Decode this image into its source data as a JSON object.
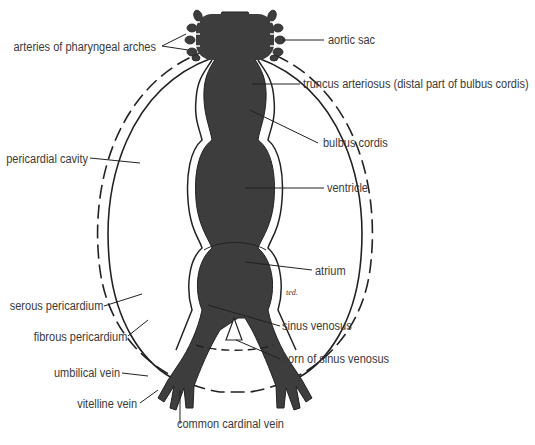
{
  "diagram": {
    "colors": {
      "heart_fill": "#3d3d3d",
      "line": "#222222",
      "label_text": "#3a3a3a",
      "background": "#ffffff"
    },
    "labels_left": [
      {
        "id": "arteries-of-pharyngeal-arches",
        "text": "arteries of pharyngeal arches"
      },
      {
        "id": "pericardial-cavity",
        "text": "pericardial cavity"
      },
      {
        "id": "serous-pericardium",
        "text": "serous pericardium"
      },
      {
        "id": "fibrous-pericardium",
        "text": "fibrous pericardium"
      },
      {
        "id": "umbilical-vein",
        "text": "umbilical vein"
      },
      {
        "id": "vitelline-vein",
        "text": "vitelline vein"
      }
    ],
    "labels_right": [
      {
        "id": "aortic-sac",
        "text": "aortic sac"
      },
      {
        "id": "truncus-arteriosus",
        "text": "truncus arteriosus (distal part of bulbus cordis)"
      },
      {
        "id": "bulbus-cordis",
        "text": "bulbus cordis"
      },
      {
        "id": "ventricle",
        "text": "ventricle"
      },
      {
        "id": "atrium",
        "text": "atrium"
      },
      {
        "id": "sinus-venosus",
        "text": "sinus venosus"
      },
      {
        "id": "horn-of-sinus-venosus",
        "text": "horn of sinus venosus"
      }
    ],
    "labels_bottom": [
      {
        "id": "common-cardinal-vein",
        "text": "common cardinal vein"
      }
    ],
    "signature": "ted."
  }
}
